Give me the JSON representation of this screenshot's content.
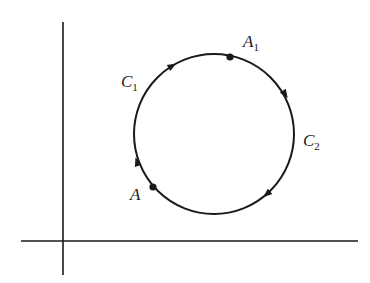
{
  "diagram": {
    "type": "closed-contour-on-axes",
    "colors": {
      "stroke": "#1a1a1a",
      "background": "#ffffff"
    },
    "axes": {
      "vertical": {
        "x": 63,
        "y_top": 22,
        "y_bottom": 275
      },
      "horizontal": {
        "y": 241,
        "x_left": 21,
        "x_right": 358
      }
    },
    "circle": {
      "cx": 214,
      "cy": 134,
      "r": 80,
      "direction": "clockwise"
    },
    "points": [
      {
        "id": "A",
        "label": "A",
        "subscript": "",
        "x": 153,
        "y": 187
      },
      {
        "id": "A1",
        "label": "A",
        "subscript": "1",
        "x": 230,
        "y": 57
      }
    ],
    "curve_labels": [
      {
        "id": "C1",
        "label": "C",
        "subscript": "1"
      },
      {
        "id": "C2",
        "label": "C",
        "subscript": "2"
      }
    ],
    "arrows": [
      {
        "x": 172,
        "y": 66,
        "note": "on C1, pointing toward A1"
      },
      {
        "x": 285,
        "y": 94,
        "note": "on C2, pointing downward"
      },
      {
        "x": 267,
        "y": 194,
        "note": "on C2, pointing toward A"
      },
      {
        "x": 137,
        "y": 162,
        "note": "on C1, pointing upward"
      }
    ]
  }
}
